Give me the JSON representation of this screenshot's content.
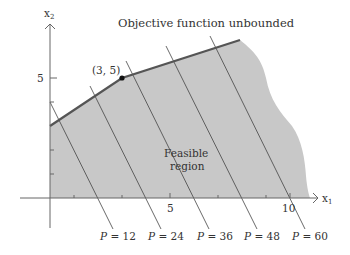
{
  "figure": {
    "title": "Objective function unbounded",
    "region_label_line1": "Feasible",
    "region_label_line2": "region",
    "point_label": "(3, 5)",
    "x_axis_label": "x",
    "x_axis_sub": "1",
    "y_axis_label": "x",
    "y_axis_sub": "2",
    "x_ticks": {
      "five": "5",
      "ten": "10"
    },
    "y_ticks": {
      "five": "5"
    },
    "iso_lines": [
      {
        "p": "P",
        "eq": " = 12"
      },
      {
        "p": "P",
        "eq": " = 24"
      },
      {
        "p": "P",
        "eq": " = 36"
      },
      {
        "p": "P",
        "eq": " = 48"
      },
      {
        "p": "P",
        "eq": " = 60"
      }
    ],
    "colors": {
      "region_fill": "#c8c8c8",
      "boundary": "#555555",
      "axis": "#666666",
      "iso_line": "#444444",
      "text": "#333333"
    }
  },
  "diagram_data": {
    "type": "linear-programming-feasible-region",
    "objective": "P = 6x1 + 3x2",
    "objective_values": [
      12,
      24,
      36,
      48,
      60
    ],
    "vertices": [
      [
        0,
        3
      ],
      [
        3,
        5
      ]
    ],
    "highlighted_point": [
      3,
      5
    ],
    "x_range": [
      0,
      11
    ],
    "y_range": [
      0,
      7
    ],
    "region": "unbounded"
  }
}
